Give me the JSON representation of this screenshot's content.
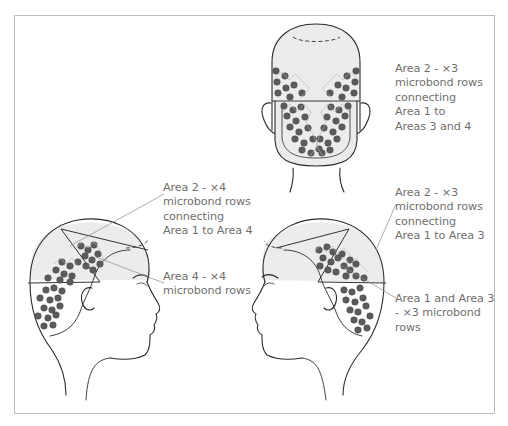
{
  "diagram": {
    "title": "",
    "views": [
      {
        "id": "back",
        "name": "Back view of head",
        "label": "Area 2 - ×3\nmicrobond rows\nconnecting\nArea 1 to\nAreas 3 and 4"
      },
      {
        "id": "left-profile",
        "name": "Left-facing profile (right side of head)",
        "labels": [
          "Area 2 - ×4\nmicrobond rows\nconnecting\nArea 1 to Area 4",
          "Area 4 - ×4\nmicrobond rows"
        ]
      },
      {
        "id": "right-profile",
        "name": "Right-facing profile (left side of head)",
        "labels": [
          "Area 2 - ×3\nmicrobond rows\nconnecting\nArea 1 to Area 3",
          "Area 1 and Area 3\n- ×3 microbond\nrows"
        ]
      }
    ],
    "colors": {
      "frame": "#bdbdbd",
      "text": "#6f6f6f",
      "dots": "#5b5b5b",
      "outline": "#2b2b2b",
      "area_shade": "#ececec"
    }
  }
}
